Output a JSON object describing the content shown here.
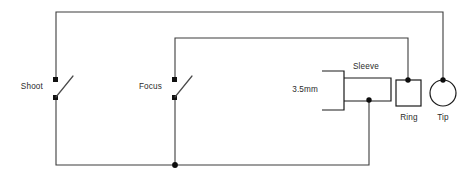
{
  "diagram": {
    "background_color": "#ffffff",
    "wire_color": "#3c3c3c",
    "component_color": "#1a1a1a",
    "text_color": "#2b2b2b"
  },
  "labels": {
    "shoot": "Shoot",
    "focus": "Focus",
    "jack_size": "3.5mm",
    "sleeve": "Sleeve",
    "ring": "Ring",
    "tip": "Tip"
  },
  "components": [
    {
      "id": "shoot-switch",
      "type": "spst-switch",
      "label": "Shoot",
      "state": "open"
    },
    {
      "id": "focus-switch",
      "type": "spst-switch",
      "label": "Focus",
      "state": "open"
    },
    {
      "id": "jack",
      "type": "trs-jack-3.5mm",
      "label": "3.5mm"
    },
    {
      "id": "sleeve-contact",
      "type": "contact",
      "label": "Sleeve"
    },
    {
      "id": "ring-contact",
      "type": "square-contact",
      "label": "Ring"
    },
    {
      "id": "tip-contact",
      "type": "circle-contact",
      "label": "Tip"
    }
  ],
  "connections": [
    {
      "from": "shoot-switch",
      "to": "tip-contact",
      "path": "outer-top-rail"
    },
    {
      "from": "focus-switch",
      "to": "ring-contact",
      "path": "inner-top-rail"
    },
    {
      "from": "shoot-switch",
      "to": "sleeve-contact",
      "path": "bottom-rail"
    },
    {
      "from": "focus-switch",
      "to": "sleeve-contact",
      "path": "bottom-rail"
    }
  ]
}
